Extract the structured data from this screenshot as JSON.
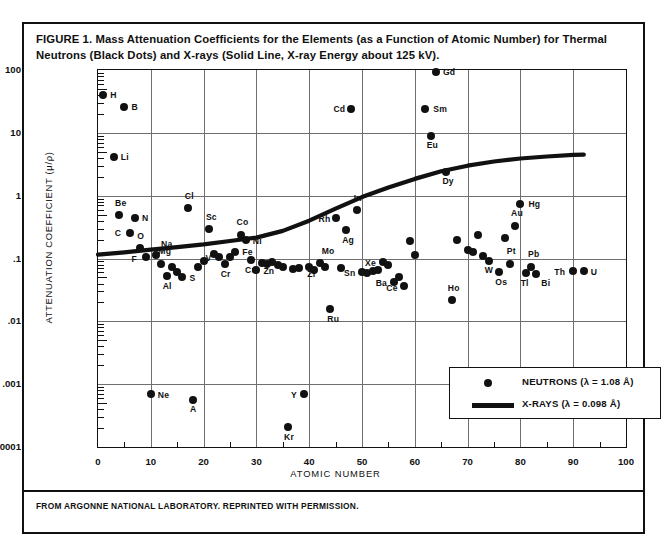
{
  "figure": {
    "caption": "FIGURE 1. Mass Attenuation Coefficients for the Elements (as a Function of Atomic Number) for Thermal Neutrons (Black Dots) and X-rays (Solid Line, X-ray Energy about 125 kV).",
    "source_note": "FROM ARGONNE NATIONAL LABORATORY. REPRINTED WITH PERMISSION."
  },
  "chart_data": {
    "type": "scatter",
    "title": "Mass Attenuation Coefficients for the Elements",
    "xlabel": "ATOMIC NUMBER",
    "ylabel": "ATTENUATION COEFFICIENT (μ/ρ)",
    "xlim": [
      0,
      100
    ],
    "ylim": [
      0.0001,
      100
    ],
    "yscale": "log",
    "xscale": "linear",
    "grid": true,
    "xticks": [
      0,
      10,
      20,
      30,
      40,
      50,
      60,
      70,
      80,
      90,
      100
    ],
    "xtick_labels": [
      "0",
      "10",
      "20",
      "30",
      "40",
      "50",
      "60",
      "70",
      "80",
      "90",
      "100"
    ],
    "yticks": [
      0.0001,
      0.001,
      0.01,
      0.1,
      1,
      10,
      100
    ],
    "ytick_labels": [
      ".0001",
      ".001",
      ".01",
      ".1",
      "1",
      "10",
      "100"
    ],
    "legend_position": "lower right",
    "series": [
      {
        "name": "NEUTRONS (λ = 1.08 Å)",
        "type": "scatter",
        "marker": "filled-circle",
        "color": "#111111",
        "points": [
          {
            "label": "H",
            "z": 1,
            "value": 40,
            "lx": 7,
            "ly": -5
          },
          {
            "label": "B",
            "z": 5,
            "value": 26,
            "lx": 7,
            "ly": -5
          },
          {
            "label": "Li",
            "z": 3,
            "value": 4.2,
            "lx": 7,
            "ly": -5
          },
          {
            "label": "Be",
            "z": 4,
            "value": 0.5,
            "lx": -4,
            "ly": -17
          },
          {
            "label": "N",
            "z": 7,
            "value": 0.44,
            "lx": 7,
            "ly": -5
          },
          {
            "label": "C",
            "z": 6,
            "value": 0.25,
            "lx": -15,
            "ly": -5
          },
          {
            "label": "O",
            "z": 8,
            "value": 0.145,
            "lx": -3,
            "ly": -17
          },
          {
            "label": "F",
            "z": 9,
            "value": 0.105,
            "lx": -14,
            "ly": -3
          },
          {
            "label": "Na",
            "z": 11,
            "value": 0.113,
            "lx": 5,
            "ly": -16
          },
          {
            "label": "Mg",
            "z": 12,
            "value": 0.082,
            "lx": -3,
            "ly": -18
          },
          {
            "label": "Al",
            "z": 13,
            "value": 0.052,
            "lx": -4,
            "ly": 5
          },
          {
            "label": "S",
            "z": 16,
            "value": 0.05,
            "lx": 7,
            "ly": -4
          },
          {
            "label": "Cl",
            "z": 17,
            "value": 0.63,
            "lx": -3,
            "ly": -17
          },
          {
            "label": "Sc",
            "z": 21,
            "value": 0.3,
            "lx": -3,
            "ly": -17
          },
          {
            "label": "V",
            "z": 23,
            "value": 0.105,
            "lx": -14,
            "ly": -4
          },
          {
            "label": "Cr",
            "z": 24,
            "value": 0.083,
            "lx": -4,
            "ly": 5
          },
          {
            "label": "Co",
            "z": 27,
            "value": 0.235,
            "lx": -4,
            "ly": -18
          },
          {
            "label": "Fe",
            "z": 26,
            "value": 0.125,
            "lx": 7,
            "ly": -5
          },
          {
            "label": "Ni",
            "z": 28,
            "value": 0.195,
            "lx": 7,
            "ly": -4
          },
          {
            "label": "Cu",
            "z": 29,
            "value": 0.094,
            "lx": -6,
            "ly": 5
          },
          {
            "label": "Zn",
            "z": 30,
            "value": 0.066,
            "lx": 7,
            "ly": -4
          },
          {
            "label": "Zr",
            "z": 40,
            "value": 0.072,
            "lx": -2,
            "ly": 2
          },
          {
            "label": "Mo",
            "z": 42,
            "value": 0.086,
            "lx": 2,
            "ly": -17
          },
          {
            "label": "Ru",
            "z": 44,
            "value": 0.0155,
            "lx": -3,
            "ly": 5
          },
          {
            "label": "Rh",
            "z": 45,
            "value": 0.44,
            "lx": -17,
            "ly": -4
          },
          {
            "label": "Ag",
            "z": 47,
            "value": 0.28,
            "lx": -4,
            "ly": 5
          },
          {
            "label": "Cd",
            "z": 48,
            "value": 24,
            "lx": -18,
            "ly": -5
          },
          {
            "label": "In",
            "z": 49,
            "value": 0.6,
            "lx": -3,
            "ly": -17
          },
          {
            "label": "Sn",
            "z": 50,
            "value": 0.06,
            "lx": -18,
            "ly": -4
          },
          {
            "label": "Xe",
            "z": 54,
            "value": 0.088,
            "lx": -18,
            "ly": -4
          },
          {
            "label": "Ba",
            "z": 56,
            "value": 0.042,
            "lx": -18,
            "ly": -4
          },
          {
            "label": "Ce",
            "z": 58,
            "value": 0.036,
            "lx": -18,
            "ly": -3
          },
          {
            "label": "Sm",
            "z": 62,
            "value": 24,
            "lx": 8,
            "ly": -5
          },
          {
            "label": "Eu",
            "z": 63,
            "value": 9.0,
            "lx": -4,
            "ly": 4
          },
          {
            "label": "Gd",
            "z": 64,
            "value": 92,
            "lx": 7,
            "ly": -5
          },
          {
            "label": "Dy",
            "z": 66,
            "value": 2.4,
            "lx": -4,
            "ly": 4
          },
          {
            "label": "Ho",
            "z": 67,
            "value": 0.022,
            "lx": -4,
            "ly": -17
          },
          {
            "label": "W",
            "z": 74,
            "value": 0.09,
            "lx": -4,
            "ly": 4
          },
          {
            "label": "Os",
            "z": 76,
            "value": 0.062,
            "lx": -4,
            "ly": 5
          },
          {
            "label": "Pt",
            "z": 78,
            "value": 0.082,
            "lx": -3,
            "ly": -18
          },
          {
            "label": "Au",
            "z": 79,
            "value": 0.33,
            "lx": -4,
            "ly": -18
          },
          {
            "label": "Hg",
            "z": 80,
            "value": 0.73,
            "lx": 8,
            "ly": -5
          },
          {
            "label": "Tl",
            "z": 81,
            "value": 0.058,
            "lx": -5,
            "ly": 5
          },
          {
            "label": "Pb",
            "z": 82,
            "value": 0.074,
            "lx": -3,
            "ly": -18
          },
          {
            "label": "Bi",
            "z": 83,
            "value": 0.056,
            "lx": 5,
            "ly": 4
          },
          {
            "label": "Th",
            "z": 90,
            "value": 0.064,
            "lx": -19,
            "ly": -4
          },
          {
            "label": "U",
            "z": 92,
            "value": 0.063,
            "lx": 7,
            "ly": -4
          },
          {
            "label": "Ne",
            "z": 10,
            "value": 0.0007,
            "lx": 7,
            "ly": -4
          },
          {
            "label": "A",
            "z": 18,
            "value": 0.00055,
            "lx": -3,
            "ly": 4
          },
          {
            "label": "Y",
            "z": 39,
            "value": 0.0007,
            "lx": -13,
            "ly": -4
          },
          {
            "label": "Kr",
            "z": 36,
            "value": 0.00021,
            "lx": -4,
            "ly": 5
          },
          {
            "label": "",
            "z": 14,
            "value": 0.074,
            "lx": 0,
            "ly": 0
          },
          {
            "label": "",
            "z": 15,
            "value": 0.062,
            "lx": 0,
            "ly": 0
          },
          {
            "label": "",
            "z": 19,
            "value": 0.072,
            "lx": 0,
            "ly": 0
          },
          {
            "label": "",
            "z": 20,
            "value": 0.09,
            "lx": 0,
            "ly": 0
          },
          {
            "label": "",
            "z": 22,
            "value": 0.12,
            "lx": 0,
            "ly": 0
          },
          {
            "label": "",
            "z": 25,
            "value": 0.107,
            "lx": 0,
            "ly": 0
          },
          {
            "label": "",
            "z": 31,
            "value": 0.086,
            "lx": 0,
            "ly": 0
          },
          {
            "label": "",
            "z": 32,
            "value": 0.082,
            "lx": 0,
            "ly": 0
          },
          {
            "label": "",
            "z": 33,
            "value": 0.088,
            "lx": 0,
            "ly": 0
          },
          {
            "label": "",
            "z": 34,
            "value": 0.08,
            "lx": 0,
            "ly": 0
          },
          {
            "label": "",
            "z": 35,
            "value": 0.074,
            "lx": 0,
            "ly": 0
          },
          {
            "label": "",
            "z": 37,
            "value": 0.068,
            "lx": 0,
            "ly": 0
          },
          {
            "label": "",
            "z": 38,
            "value": 0.07,
            "lx": 0,
            "ly": 0
          },
          {
            "label": "",
            "z": 41,
            "value": 0.066,
            "lx": 0,
            "ly": 0
          },
          {
            "label": "",
            "z": 43,
            "value": 0.072,
            "lx": 0,
            "ly": 0
          },
          {
            "label": "",
            "z": 46,
            "value": 0.07,
            "lx": 0,
            "ly": 0
          },
          {
            "label": "",
            "z": 51,
            "value": 0.058,
            "lx": 0,
            "ly": 0
          },
          {
            "label": "",
            "z": 52,
            "value": 0.063,
            "lx": 0,
            "ly": 0
          },
          {
            "label": "",
            "z": 53,
            "value": 0.066,
            "lx": 0,
            "ly": 0
          },
          {
            "label": "",
            "z": 55,
            "value": 0.08,
            "lx": 0,
            "ly": 0
          },
          {
            "label": "",
            "z": 57,
            "value": 0.05,
            "lx": 0,
            "ly": 0
          },
          {
            "label": "",
            "z": 59,
            "value": 0.19,
            "lx": 0,
            "ly": 0
          },
          {
            "label": "",
            "z": 60,
            "value": 0.115,
            "lx": 0,
            "ly": 0
          },
          {
            "label": "",
            "z": 68,
            "value": 0.195,
            "lx": 0,
            "ly": 0
          },
          {
            "label": "",
            "z": 70,
            "value": 0.135,
            "lx": 0,
            "ly": 0
          },
          {
            "label": "",
            "z": 71,
            "value": 0.125,
            "lx": 0,
            "ly": 0
          },
          {
            "label": "",
            "z": 72,
            "value": 0.24,
            "lx": 0,
            "ly": 0
          },
          {
            "label": "",
            "z": 73,
            "value": 0.108,
            "lx": 0,
            "ly": 0
          },
          {
            "label": "",
            "z": 77,
            "value": 0.215,
            "lx": 0,
            "ly": 0
          }
        ]
      },
      {
        "name": "X-RAYS (λ = 0.098 Å)",
        "type": "line",
        "color": "#111111",
        "x": [
          0,
          5,
          10,
          15,
          20,
          25,
          30,
          35,
          40,
          45,
          50,
          55,
          60,
          65,
          70,
          75,
          80,
          85,
          90,
          92
        ],
        "y": [
          0.115,
          0.125,
          0.138,
          0.152,
          0.168,
          0.19,
          0.215,
          0.275,
          0.4,
          0.62,
          0.95,
          1.35,
          1.85,
          2.45,
          3.0,
          3.5,
          3.9,
          4.2,
          4.45,
          4.5
        ]
      }
    ]
  },
  "legend": {
    "neutrons_label": "NEUTRONS (λ = 1.08 Å)",
    "xrays_label": "X-RAYS (λ = 0.098 Å)"
  }
}
